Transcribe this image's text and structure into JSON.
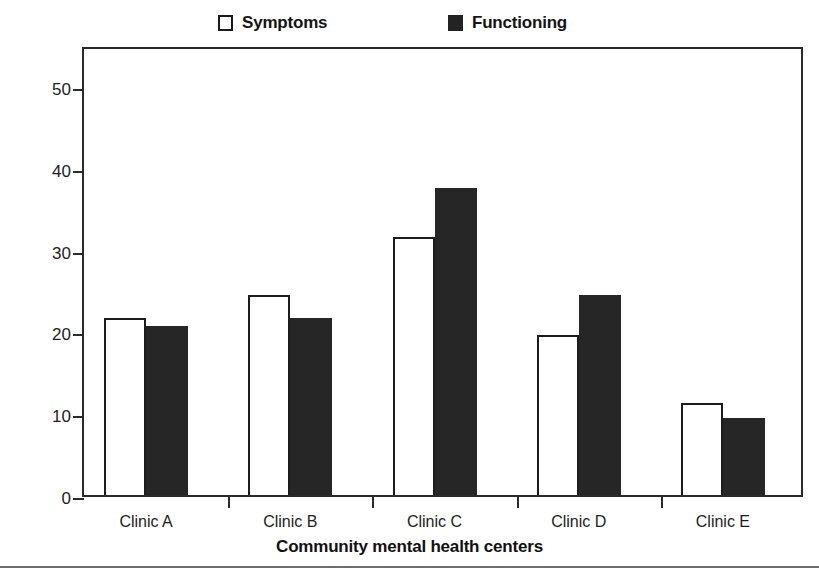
{
  "chart_data": {
    "type": "bar",
    "title": "",
    "xlabel": "Community mental health centers",
    "ylabel": "6-Month change score",
    "categories": [
      "Clinic A",
      "Clinic B",
      "Clinic C",
      "Clinic D",
      "Clinic E"
    ],
    "series": [
      {
        "name": "Symptoms",
        "values": [
          21.6,
          24.5,
          31.5,
          19.6,
          11.3
        ],
        "style": "open",
        "color": "#ffffff"
      },
      {
        "name": "Functioning",
        "values": [
          20.7,
          21.6,
          37.5,
          24.5,
          9.4
        ],
        "style": "filled",
        "color": "#262626"
      }
    ],
    "ylim": [
      0,
      55
    ],
    "yticks": [
      0,
      10,
      20,
      30,
      40,
      50
    ],
    "ytick_labels": [
      "0",
      "10",
      "20",
      "30",
      "40",
      "50"
    ],
    "grid": false,
    "legend_position": "top"
  },
  "legend": {
    "items": [
      {
        "label": "Symptoms",
        "swatch": "open-square-icon"
      },
      {
        "label": "Functioning",
        "swatch": "filled-square-icon"
      }
    ]
  }
}
